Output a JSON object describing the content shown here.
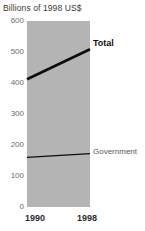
{
  "chart_data": {
    "type": "line",
    "title": "Billions of 1998 US$",
    "xlabel": "",
    "ylabel": "",
    "x": [
      1990,
      1998
    ],
    "categories": [
      "1990",
      "1998"
    ],
    "series": [
      {
        "name": "Total",
        "values": [
          412,
          509
        ]
      },
      {
        "name": "Government",
        "values": [
          160,
          172
        ]
      }
    ],
    "ylim": [
      0,
      600
    ],
    "yticks": [
      0,
      100,
      200,
      300,
      400,
      500,
      600
    ],
    "ytick_labels": [
      "0",
      "100",
      "200",
      "300",
      "400",
      "500",
      "600"
    ],
    "xtick_labels": [
      "1990",
      "1998"
    ],
    "grid": false,
    "legend": "inline-annotations",
    "plot_background_color": "#b4b4b4",
    "series_line_color": "#0d0d0d"
  },
  "annotations": {
    "total_label": "Total",
    "government_label": "Government"
  }
}
